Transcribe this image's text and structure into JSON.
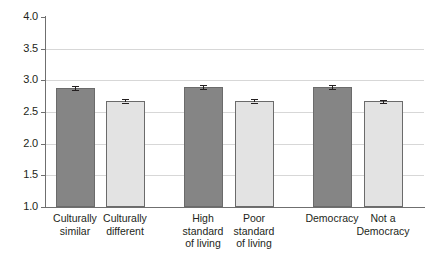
{
  "chart_data": {
    "type": "bar",
    "title": "",
    "subtitle": "",
    "xlabel": "",
    "ylabel": "",
    "ylim": [
      1.0,
      4.0
    ],
    "ytick_labels": [
      "4.0",
      "3.5",
      "3.0",
      "2.5",
      "2.0",
      "1.5",
      "1.0"
    ],
    "ytick_values": [
      4.0,
      3.5,
      3.0,
      2.5,
      2.0,
      1.5,
      1.0
    ],
    "grid": true,
    "legend": "none",
    "categories": [
      "Culturally\nsimilar",
      "Culturally\ndifferent",
      "High\nstandard\nof living",
      "Poor\nstandard\nof living",
      "Democracy",
      "Not a\nDemocracy"
    ],
    "values": [
      2.88,
      2.68,
      2.89,
      2.68,
      2.9,
      2.67
    ],
    "errors": [
      0.035,
      0.03,
      0.03,
      0.03,
      0.03,
      0.025
    ],
    "bar_styles": [
      "dark",
      "light",
      "dark",
      "light",
      "dark",
      "light"
    ],
    "colors": {
      "dark_bar": "#858585",
      "light_bar": "#e3e3e3",
      "bar_border": "#6b6b6b",
      "axis": "#6f6f6f",
      "gridline": "#d7d7d7",
      "error_bar": "#231f20",
      "text": "#231f20",
      "background": "#ffffff"
    }
  }
}
